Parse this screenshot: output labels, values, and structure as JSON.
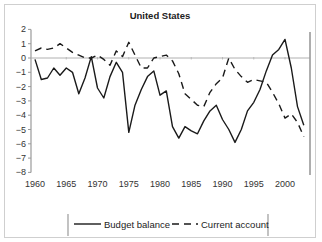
{
  "chart_data": {
    "type": "line",
    "title": "United States",
    "xlabel": "",
    "ylabel": "",
    "ylim": [
      -8,
      2
    ],
    "xlim": [
      1960,
      2003
    ],
    "yticks": [
      2,
      1,
      0,
      -1,
      -2,
      -3,
      -4,
      -5,
      -6,
      -7,
      -8
    ],
    "xticks": [
      1960,
      1965,
      1970,
      1975,
      1980,
      1985,
      1990,
      1995,
      2000
    ],
    "grid": false,
    "legend_position": "bottom",
    "x": [
      1960,
      1961,
      1962,
      1963,
      1964,
      1965,
      1966,
      1967,
      1968,
      1969,
      1970,
      1971,
      1972,
      1973,
      1974,
      1975,
      1976,
      1977,
      1978,
      1979,
      1980,
      1981,
      1982,
      1983,
      1984,
      1985,
      1986,
      1987,
      1988,
      1989,
      1990,
      1991,
      1992,
      1993,
      1994,
      1995,
      1996,
      1997,
      1998,
      1999,
      2000,
      2001,
      2002,
      2003
    ],
    "series": [
      {
        "name": "Budget balance",
        "style": "solid",
        "values": [
          -0.1,
          -1.5,
          -1.4,
          -0.7,
          -1.2,
          -0.7,
          -1.0,
          -2.5,
          -1.4,
          0.1,
          -2.1,
          -2.8,
          -1.3,
          -0.3,
          -1.0,
          -5.2,
          -3.3,
          -2.2,
          -1.3,
          -0.9,
          -2.6,
          -2.3,
          -4.8,
          -5.6,
          -4.8,
          -5.1,
          -5.3,
          -4.4,
          -3.7,
          -3.3,
          -4.3,
          -5.0,
          -5.9,
          -5.0,
          -3.7,
          -3.1,
          -2.2,
          -0.9,
          0.2,
          0.6,
          1.3,
          -0.7,
          -3.4,
          -4.7
        ]
      },
      {
        "name": "Current account",
        "style": "dashed",
        "values": [
          0.5,
          0.7,
          0.6,
          0.7,
          1.0,
          0.7,
          0.4,
          0.2,
          0.0,
          0.0,
          0.2,
          -0.1,
          -0.5,
          0.5,
          0.1,
          1.1,
          0.2,
          -0.7,
          -0.7,
          0.0,
          0.1,
          0.2,
          -0.2,
          -1.1,
          -2.5,
          -2.9,
          -3.3,
          -3.4,
          -2.4,
          -1.8,
          -1.4,
          0.0,
          -0.8,
          -1.3,
          -1.7,
          -1.5,
          -1.6,
          -1.7,
          -2.4,
          -3.2,
          -4.2,
          -3.9,
          -4.5,
          -5.5
        ]
      }
    ]
  },
  "legend": {
    "items": [
      {
        "label": "Budget balance",
        "style": "solid"
      },
      {
        "label": "Current account",
        "style": "dashed"
      }
    ]
  },
  "colors": {
    "line": "#1a1a1a",
    "axis": "#9a9a9a",
    "zero_line": "#b0b0b0"
  }
}
